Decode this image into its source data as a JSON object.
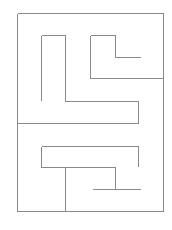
{
  "diagram": {
    "type": "maze",
    "wall_color": "#8a8a8a",
    "background": "#ffffff",
    "walls": [
      {
        "id": "outer-top",
        "x1": 17,
        "y1": 13,
        "x2": 163,
        "y2": 13
      },
      {
        "id": "outer-left",
        "x1": 17,
        "y1": 13,
        "x2": 17,
        "y2": 211
      },
      {
        "id": "outer-right",
        "x1": 163,
        "y1": 13,
        "x2": 163,
        "y2": 211
      },
      {
        "id": "outer-bottom",
        "x1": 17,
        "y1": 211,
        "x2": 163,
        "y2": 211
      },
      {
        "id": "a-top",
        "x1": 41,
        "y1": 35,
        "x2": 65,
        "y2": 35
      },
      {
        "id": "a-left",
        "x1": 41,
        "y1": 35,
        "x2": 41,
        "y2": 100
      },
      {
        "id": "a-right",
        "x1": 65,
        "y1": 35,
        "x2": 65,
        "y2": 101
      },
      {
        "id": "a-bottom",
        "x1": 65,
        "y1": 101,
        "x2": 138,
        "y2": 101
      },
      {
        "id": "a-drop",
        "x1": 138,
        "y1": 101,
        "x2": 138,
        "y2": 123
      },
      {
        "id": "mid-horizontal",
        "x1": 17,
        "y1": 123,
        "x2": 138,
        "y2": 123
      },
      {
        "id": "b-top",
        "x1": 90,
        "y1": 35,
        "x2": 115,
        "y2": 35
      },
      {
        "id": "b-left",
        "x1": 90,
        "y1": 35,
        "x2": 90,
        "y2": 78
      },
      {
        "id": "b-inner-vertical",
        "x1": 115,
        "y1": 35,
        "x2": 115,
        "y2": 57
      },
      {
        "id": "b-inner-horizontal",
        "x1": 115,
        "y1": 57,
        "x2": 140,
        "y2": 57
      },
      {
        "id": "b-bottom",
        "x1": 90,
        "y1": 78,
        "x2": 163,
        "y2": 78
      },
      {
        "id": "c-top",
        "x1": 41,
        "y1": 146,
        "x2": 138,
        "y2": 146
      },
      {
        "id": "c-right",
        "x1": 138,
        "y1": 146,
        "x2": 138,
        "y2": 166
      },
      {
        "id": "c-left",
        "x1": 41,
        "y1": 146,
        "x2": 41,
        "y2": 167
      },
      {
        "id": "c-bottom",
        "x1": 41,
        "y1": 167,
        "x2": 115,
        "y2": 167
      },
      {
        "id": "d-stem",
        "x1": 65,
        "y1": 167,
        "x2": 65,
        "y2": 211
      },
      {
        "id": "e-vertical",
        "x1": 115,
        "y1": 167,
        "x2": 115,
        "y2": 189
      },
      {
        "id": "e-horizontal",
        "x1": 92,
        "y1": 189,
        "x2": 140,
        "y2": 189
      }
    ]
  }
}
